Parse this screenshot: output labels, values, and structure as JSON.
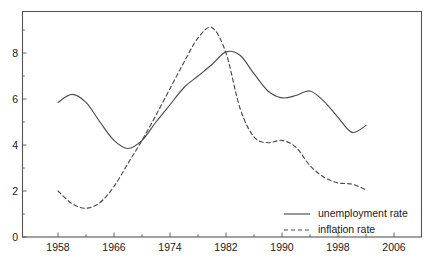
{
  "chart_data": {
    "type": "line",
    "title": "",
    "subtitle": "",
    "xlabel": "",
    "ylabel": "",
    "xlim": [
      1954,
      2006
    ],
    "ylim": [
      0,
      9.6
    ],
    "grid": false,
    "legend_position": "bottom-right",
    "x_ticks_major": [
      1958,
      1966,
      1974,
      1982,
      1990,
      1998,
      2006
    ],
    "x_tick_labels": [
      "1958",
      "1966",
      "1974",
      "1982",
      "1990",
      "1998",
      "2006"
    ],
    "x_ticks_minor": [
      1962,
      1970,
      1978,
      1986,
      1994,
      2002
    ],
    "y_ticks_major": [
      0,
      2,
      4,
      6,
      8
    ],
    "y_tick_labels": [
      "0",
      "2",
      "4",
      "6",
      "8"
    ],
    "y_ticks_minor": [
      1,
      3,
      5,
      7,
      9
    ],
    "series": [
      {
        "name": "unemployment rate",
        "style": "solid",
        "color": "#4a4a52",
        "x": [
          1958,
          1960,
          1962,
          1964,
          1966,
          1968,
          1970,
          1972,
          1974,
          1976,
          1978,
          1980,
          1982,
          1984,
          1986,
          1988,
          1990,
          1992,
          1994,
          1996,
          1998,
          2000,
          2002
        ],
        "values": [
          5.85,
          6.2,
          5.85,
          5.0,
          4.2,
          3.85,
          4.2,
          5.0,
          5.75,
          6.5,
          7.0,
          7.5,
          8.05,
          7.9,
          7.1,
          6.35,
          6.05,
          6.15,
          6.35,
          5.9,
          5.2,
          4.55,
          4.85
        ]
      },
      {
        "name": "inflation rate",
        "style": "dashed",
        "color": "#4a4a52",
        "x": [
          1958,
          1960,
          1962,
          1964,
          1966,
          1968,
          1970,
          1972,
          1974,
          1976,
          1978,
          1980,
          1982,
          1984,
          1986,
          1988,
          1990,
          1992,
          1994,
          1996,
          1998,
          2000,
          2002
        ],
        "values": [
          2.0,
          1.45,
          1.25,
          1.5,
          2.2,
          3.2,
          4.2,
          5.3,
          6.45,
          7.6,
          8.65,
          9.1,
          8.0,
          5.6,
          4.35,
          4.1,
          4.2,
          3.9,
          3.1,
          2.6,
          2.35,
          2.3,
          2.05
        ]
      }
    ],
    "legend": [
      {
        "label": "unemployment rate",
        "style": "solid"
      },
      {
        "label": "inflation rate",
        "style": "dashed"
      }
    ]
  },
  "colors": {
    "background": "#ffffff",
    "axis": "#555555",
    "line": "#4a4a52",
    "text": "#1a1a1a"
  }
}
